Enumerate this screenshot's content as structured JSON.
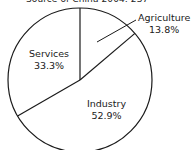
{
  "header": {
    "caption": "Source of China 2004: 237"
  },
  "chart_data": {
    "type": "pie",
    "title": "Source of China 2004: 237",
    "categories": [
      "Agriculture",
      "Industry",
      "Services"
    ],
    "values": [
      13.8,
      52.9,
      33.3
    ],
    "unit": "%",
    "labels": [
      {
        "name": "Agriculture",
        "value": "13.8%"
      },
      {
        "name": "Industry",
        "value": "52.9%"
      },
      {
        "name": "Services",
        "value": "33.3%"
      }
    ],
    "start_angle": "12 o'clock, clockwise",
    "fill": "#ffffff",
    "stroke": "#1a1a1a",
    "legend": "none (direct labels)"
  }
}
